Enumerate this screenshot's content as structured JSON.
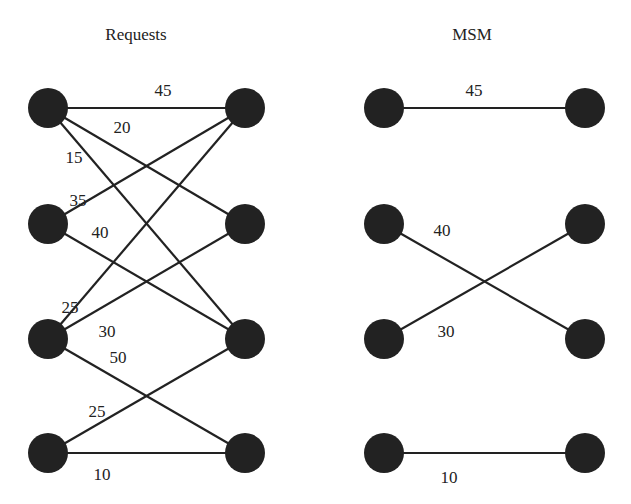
{
  "colors": {
    "node": "#222222",
    "edge": "#222222",
    "text": "#222222",
    "background": "#ffffff"
  },
  "node_radius": 20,
  "graphs": [
    {
      "title": "Requests",
      "title_pos": [
        136,
        40
      ],
      "left_nodes": [
        [
          48,
          108
        ],
        [
          48,
          224
        ],
        [
          48,
          339
        ],
        [
          48,
          453
        ]
      ],
      "right_nodes": [
        [
          245,
          108
        ],
        [
          245,
          224
        ],
        [
          245,
          339
        ],
        [
          245,
          453
        ]
      ],
      "edges": [
        {
          "from": 0,
          "to": 0,
          "weight": "45",
          "label_pos": [
            163,
            96
          ]
        },
        {
          "from": 0,
          "to": 1,
          "weight": "20",
          "label_pos": [
            122,
            133
          ]
        },
        {
          "from": 0,
          "to": 2,
          "weight": "15",
          "label_pos": [
            74,
            163
          ]
        },
        {
          "from": 1,
          "to": 0,
          "weight": "35",
          "label_pos": [
            78,
            206
          ]
        },
        {
          "from": 1,
          "to": 2,
          "weight": "40",
          "label_pos": [
            100,
            238
          ]
        },
        {
          "from": 2,
          "to": 0,
          "weight": "25",
          "label_pos": [
            70,
            313
          ]
        },
        {
          "from": 2,
          "to": 1,
          "weight": "30",
          "label_pos": [
            107,
            337
          ]
        },
        {
          "from": 2,
          "to": 3,
          "weight": "50",
          "label_pos": [
            118,
            363
          ]
        },
        {
          "from": 3,
          "to": 2,
          "weight": "25",
          "label_pos": [
            97,
            417
          ]
        },
        {
          "from": 3,
          "to": 3,
          "weight": "10",
          "label_pos": [
            102,
            480
          ]
        }
      ]
    },
    {
      "title": "MSM",
      "title_pos": [
        472,
        40
      ],
      "left_nodes": [
        [
          384,
          108
        ],
        [
          384,
          224
        ],
        [
          384,
          339
        ],
        [
          384,
          453
        ]
      ],
      "right_nodes": [
        [
          585,
          108
        ],
        [
          585,
          224
        ],
        [
          585,
          339
        ],
        [
          585,
          453
        ]
      ],
      "edges": [
        {
          "from": 0,
          "to": 0,
          "weight": "45",
          "label_pos": [
            474,
            96
          ]
        },
        {
          "from": 1,
          "to": 2,
          "weight": "40",
          "label_pos": [
            442,
            236
          ]
        },
        {
          "from": 2,
          "to": 1,
          "weight": "30",
          "label_pos": [
            446,
            337
          ]
        },
        {
          "from": 3,
          "to": 3,
          "weight": "10",
          "label_pos": [
            449,
            483
          ]
        }
      ]
    }
  ]
}
